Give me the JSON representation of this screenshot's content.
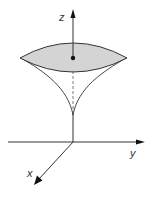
{
  "diagram": {
    "axes": {
      "z_label": "z",
      "y_label": "y",
      "x_label": "x"
    },
    "colors": {
      "line": "#333333",
      "fill": "#d4d4d4",
      "background": "#ffffff"
    }
  }
}
